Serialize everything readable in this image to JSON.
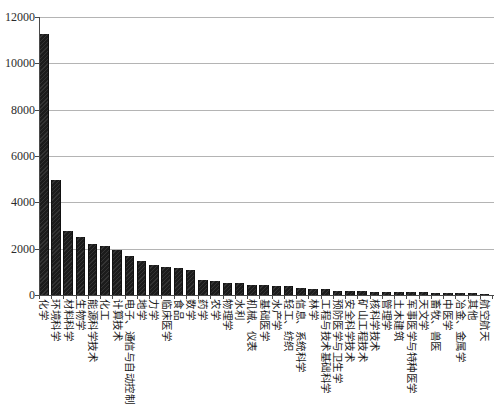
{
  "figure": {
    "background": "#ffffff",
    "width": 499,
    "height": 414
  },
  "chart_data": {
    "type": "bar",
    "title": "",
    "xlabel": "",
    "ylabel": "",
    "legend": "none",
    "grid": "horizontal",
    "bar_color": "#1c1c1c",
    "gridline_color": "#b4b4b4",
    "axis_color": "#4a4a4a",
    "label_rotation": "vertical-90deg",
    "ylim": [
      0,
      12000
    ],
    "yticks": [
      0,
      2000,
      4000,
      6000,
      8000,
      10000,
      12000
    ],
    "categories": [
      "化学",
      "环境科学",
      "材料科学",
      "生物学",
      "能源科学技术",
      "化工",
      "计算技术",
      "电子、通信与自动控制",
      "地学",
      "力学",
      "临床医学",
      "食品",
      "数学",
      "药学",
      "农学",
      "物理学",
      "水利",
      "机械、仪表",
      "基础医学",
      "水产学",
      "轻工、纺织",
      "信息、系统科学",
      "林学",
      "工程与技术基础科学",
      "预防医学与卫生学",
      "安全科学技术",
      "矿山工程技术",
      "核科学技术",
      "管理学",
      "土木建筑",
      "军事医学与特种医学",
      "天文学",
      "畜牧、兽医",
      "中医学",
      "冶金、金属学",
      "其他",
      "航空航天"
    ],
    "values": [
      11250,
      4950,
      2750,
      2500,
      2200,
      2100,
      1950,
      1700,
      1450,
      1300,
      1200,
      1150,
      1100,
      650,
      620,
      520,
      500,
      450,
      430,
      410,
      390,
      300,
      280,
      260,
      180,
      170,
      160,
      150,
      130,
      125,
      115,
      110,
      90,
      85,
      80,
      70,
      50
    ]
  },
  "layout": {
    "plot_left": 39,
    "plot_right": 492,
    "plot_top": 17,
    "plot_bottom": 295
  }
}
